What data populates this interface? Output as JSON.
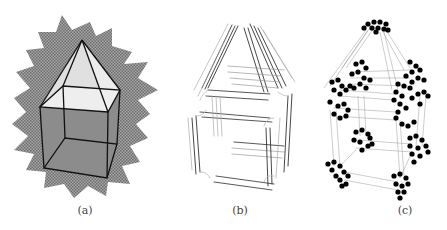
{
  "figure": {
    "panels": [
      {
        "id": "a",
        "caption": "(a)",
        "description": "wireframe house (cube with pyramid roof) on a checkered star-shaped background"
      },
      {
        "id": "b",
        "caption": "(b)",
        "description": "edge bundles of the house wireframe drawn as parallel line strokes"
      },
      {
        "id": "c",
        "caption": "(c)",
        "description": "clustered vertices (black dots) connected by thin lines forming the house shape"
      }
    ]
  },
  "colors": {
    "background": "#ffffff",
    "checker_dark": "#7a7a7a",
    "checker_light": "#a8a8a8",
    "roof_fill": "#e6e6e6",
    "body_fill": "#8a8a8a",
    "edge": "#111111",
    "dot": "#000000",
    "thin_line": "#9a9a9a"
  }
}
